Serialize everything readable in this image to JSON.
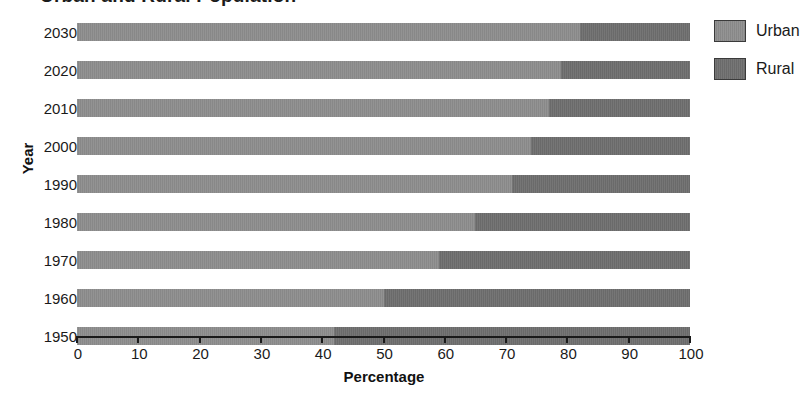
{
  "chart_data": {
    "type": "bar",
    "subtype": "stacked-horizontal-100-percent",
    "title": "Urban and Rural Population",
    "xlabel": "Percentage",
    "ylabel": "Year",
    "xlim": [
      0,
      100
    ],
    "xticks": [
      0,
      10,
      20,
      30,
      40,
      50,
      60,
      70,
      80,
      90,
      100
    ],
    "grid": false,
    "legend_position": "right",
    "categories": [
      "2030",
      "2020",
      "2010",
      "2000",
      "1990",
      "1980",
      "1970",
      "1960",
      "1950"
    ],
    "series": [
      {
        "name": "Urban",
        "color": "#8d8d8d",
        "values": [
          82,
          79,
          77,
          74,
          71,
          65,
          59,
          50,
          42
        ]
      },
      {
        "name": "Rural",
        "color": "#6e6e6e",
        "values": [
          18,
          21,
          23,
          26,
          29,
          35,
          41,
          50,
          58
        ]
      }
    ]
  },
  "legend": {
    "items": [
      {
        "label": "Urban",
        "color": "#8d8d8d"
      },
      {
        "label": "Rural",
        "color": "#6e6e6e"
      }
    ]
  }
}
